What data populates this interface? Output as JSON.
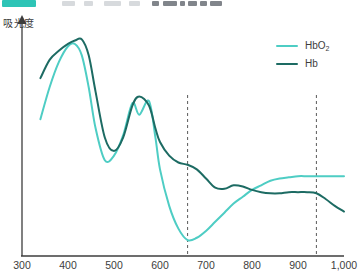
{
  "header": {
    "badge_color": "#2ec4b6",
    "placeholder_bars": [
      {
        "left": 62,
        "width": 13,
        "dark": false
      },
      {
        "left": 84,
        "width": 9,
        "dark": false
      },
      {
        "left": 104,
        "width": 17,
        "dark": false
      },
      {
        "left": 129,
        "width": 11,
        "dark": false
      },
      {
        "left": 152,
        "width": 7,
        "dark": true
      },
      {
        "left": 163,
        "width": 14,
        "dark": true
      },
      {
        "left": 180,
        "width": 5,
        "dark": true
      },
      {
        "left": 188,
        "width": 9,
        "dark": true
      },
      {
        "left": 200,
        "width": 7,
        "dark": true
      },
      {
        "left": 210,
        "width": 12,
        "dark": true
      }
    ]
  },
  "axes": {
    "ylabel": "吸光度",
    "xticks": [
      "300",
      "400",
      "500",
      "600",
      "700",
      "800",
      "900",
      "1,000"
    ],
    "xtick_values": [
      300,
      400,
      500,
      600,
      700,
      800,
      900,
      1000
    ],
    "xlim": [
      300,
      1000
    ],
    "axis_color": "#3d3d3d"
  },
  "legend": {
    "position": "top-right",
    "items": [
      {
        "label": "HbO",
        "sub": "2",
        "color": "#4ecdc4"
      },
      {
        "label": "Hb",
        "sub": "",
        "color": "#1d6b63"
      }
    ]
  },
  "markers": {
    "dashed_color": "#5a5a5a",
    "lines": [
      {
        "name": "marker-660nm",
        "value": 660
      },
      {
        "name": "marker-940nm",
        "value": 940
      }
    ]
  },
  "chart_data": {
    "type": "line",
    "title": "",
    "xlabel": "",
    "ylabel": "吸光度",
    "xlim": [
      300,
      1000
    ],
    "ylim": [
      0,
      1
    ],
    "grid": false,
    "legend_position": "top-right",
    "annotations": [
      {
        "type": "vline",
        "x": 660,
        "style": "dashed",
        "label": ""
      },
      {
        "type": "vline",
        "x": 940,
        "style": "dashed",
        "label": ""
      }
    ],
    "x": [
      340,
      360,
      380,
      400,
      415,
      430,
      445,
      460,
      480,
      500,
      520,
      540,
      555,
      576,
      590,
      600,
      620,
      640,
      660,
      680,
      700,
      720,
      740,
      760,
      780,
      800,
      820,
      840,
      860,
      880,
      900,
      920,
      940,
      960,
      980,
      1000
    ],
    "series": [
      {
        "name": "HbO2",
        "color": "#4ecdc4",
        "values": [
          0.6,
          0.74,
          0.85,
          0.92,
          0.93,
          0.88,
          0.74,
          0.56,
          0.42,
          0.44,
          0.53,
          0.67,
          0.62,
          0.68,
          0.52,
          0.38,
          0.22,
          0.12,
          0.07,
          0.08,
          0.11,
          0.15,
          0.19,
          0.23,
          0.26,
          0.29,
          0.31,
          0.33,
          0.34,
          0.345,
          0.35,
          0.35,
          0.35,
          0.35,
          0.35,
          0.35
        ]
      },
      {
        "name": "Hb",
        "color": "#1d6b63",
        "values": [
          0.78,
          0.86,
          0.9,
          0.93,
          0.945,
          0.95,
          0.88,
          0.72,
          0.52,
          0.46,
          0.52,
          0.66,
          0.7,
          0.66,
          0.56,
          0.5,
          0.44,
          0.41,
          0.4,
          0.38,
          0.34,
          0.3,
          0.295,
          0.31,
          0.305,
          0.29,
          0.28,
          0.275,
          0.275,
          0.28,
          0.28,
          0.28,
          0.275,
          0.25,
          0.22,
          0.195
        ]
      }
    ]
  }
}
